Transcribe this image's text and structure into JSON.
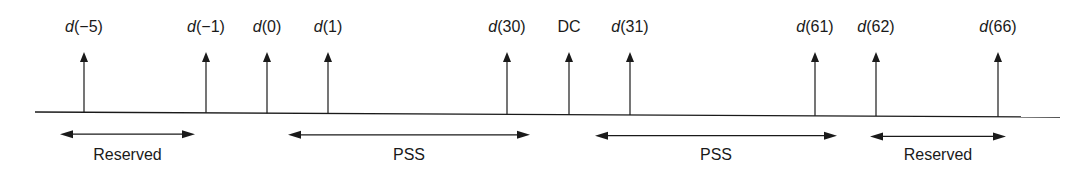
{
  "diagram": {
    "subcarriers": [
      {
        "x": 84,
        "label_prefix": "d",
        "label_index": "(−5)",
        "dc": false
      },
      {
        "x": 206,
        "label_prefix": "d",
        "label_index": "(−1)",
        "dc": false
      },
      {
        "x": 267,
        "label_prefix": "d",
        "label_index": "(0)",
        "dc": false
      },
      {
        "x": 328,
        "label_prefix": "d",
        "label_index": "(1)",
        "dc": false
      },
      {
        "x": 507,
        "label_prefix": "d",
        "label_index": "(30)",
        "dc": false
      },
      {
        "x": 569,
        "label_prefix": "",
        "label_index": "DC",
        "dc": true
      },
      {
        "x": 630,
        "label_prefix": "d",
        "label_index": "(31)",
        "dc": false
      },
      {
        "x": 815,
        "label_prefix": "d",
        "label_index": "(61)",
        "dc": false
      },
      {
        "x": 876,
        "label_prefix": "d",
        "label_index": "(62)",
        "dc": false
      },
      {
        "x": 998,
        "label_prefix": "d",
        "label_index": "(66)",
        "dc": false
      }
    ],
    "spans": [
      {
        "label": "Reserved",
        "x1": 60,
        "x2": 195,
        "style": "double"
      },
      {
        "label": "PSS",
        "x1": 288,
        "x2": 530,
        "style": "double"
      },
      {
        "label": "PSS",
        "x1": 595,
        "x2": 837,
        "style": "double"
      },
      {
        "label": "Reserved",
        "x1": 870,
        "x2": 1006,
        "style": "double"
      }
    ],
    "line_color": "#1a1a1a"
  }
}
